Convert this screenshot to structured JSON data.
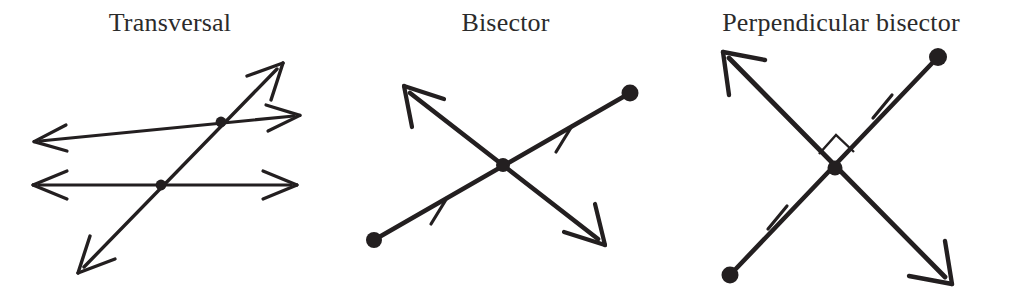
{
  "figure": {
    "background": "#ffffff",
    "ink_color": "#231f20",
    "title_color": "#2b2b2b",
    "width": 1011,
    "height": 292
  },
  "panels": [
    {
      "id": "transversal",
      "title": "Transversal",
      "description": "Two parallel double-headed arrow lines crossed by a slanted double-headed transversal line, with dots marking the two intersection points.",
      "elements": {
        "lines": 3,
        "intersection_dots": 2,
        "arrowheads": 6,
        "tick_marks": 0,
        "right_angle_marks": 0,
        "endpoint_dots": 0
      }
    },
    {
      "id": "bisector",
      "title": "Bisector",
      "description": "A segment with dot endpoints crossed by a double-headed arrow line through its midpoint; single tick marks show the two halves are congruent.",
      "elements": {
        "lines": 2,
        "intersection_dots": 1,
        "arrowheads": 2,
        "tick_marks": 2,
        "right_angle_marks": 0,
        "endpoint_dots": 2
      }
    },
    {
      "id": "perpendicular-bisector",
      "title": "Perpendicular bisector",
      "description": "A segment with dot endpoints crossed at right angles by a double-headed arrow line through its midpoint; a square marks the right angle and single ticks show congruent halves.",
      "elements": {
        "lines": 2,
        "intersection_dots": 1,
        "arrowheads": 2,
        "tick_marks": 2,
        "right_angle_marks": 1,
        "endpoint_dots": 2
      }
    }
  ]
}
